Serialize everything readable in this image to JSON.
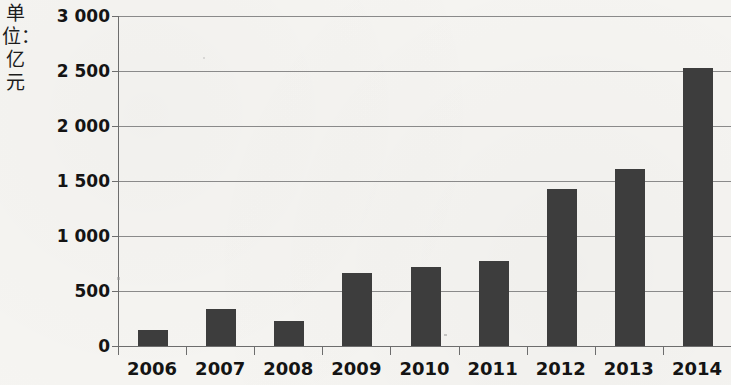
{
  "chart_data": {
    "type": "bar",
    "title": "",
    "subtitle": "",
    "xlabel": "",
    "ylabel": "单位：亿元",
    "categories": [
      "2006",
      "2007",
      "2008",
      "2009",
      "2010",
      "2011",
      "2012",
      "2013",
      "2014"
    ],
    "values": [
      145,
      335,
      230,
      660,
      715,
      770,
      1430,
      1610,
      2530
    ],
    "series": [
      {
        "name": "",
        "values": [
          145,
          335,
          230,
          660,
          715,
          770,
          1430,
          1610,
          2530
        ]
      }
    ],
    "ylim": [
      0,
      3000
    ],
    "ytick_values": [
      0,
      500,
      1000,
      1500,
      2000,
      2500,
      3000
    ],
    "ytick_labels": [
      "0",
      "500",
      "1 000",
      "1 500",
      "2 000",
      "2 500",
      "3 000"
    ],
    "grid": true,
    "legend": "none",
    "bar_color": "#3d3d3d",
    "background_color": "#f6f5f2",
    "axis_color": "#6d6d6d",
    "gridline_color": "#8a8a8a"
  },
  "axis": {
    "unit_label": "单位：亿元"
  }
}
